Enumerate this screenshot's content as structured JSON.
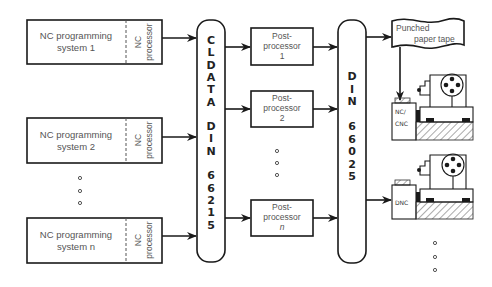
{
  "diagram": {
    "programming_systems": [
      {
        "line1": "NC programming",
        "line2": "system 1",
        "processor": [
          "NC",
          "processor"
        ]
      },
      {
        "line1": "NC programming",
        "line2": "system 2",
        "processor": [
          "NC",
          "processor"
        ]
      },
      {
        "line1": "NC programming",
        "line2": "system n",
        "processor": [
          "NC",
          "processor"
        ]
      }
    ],
    "cldata_bus": {
      "label": "CLDATA DIN 66215",
      "letters": [
        "C",
        "L",
        "D",
        "A",
        "T",
        "A",
        "",
        "D",
        "I",
        "N",
        "",
        "6",
        "6",
        "2",
        "1",
        "5"
      ]
    },
    "postprocessors": [
      {
        "line1": "Post-",
        "line2": "processor",
        "line3": "1"
      },
      {
        "line1": "Post-",
        "line2": "processor",
        "line3": "2"
      },
      {
        "line1": "Post-",
        "line2": "processor",
        "line3": "n"
      }
    ],
    "din_bus": {
      "label": "DIN 66025",
      "letters": [
        "D",
        "I",
        "N",
        "",
        "6",
        "6",
        "0",
        "2",
        "5"
      ]
    },
    "paper_tape": {
      "line1": "Punched",
      "line2": "paper tape"
    },
    "machines": [
      {
        "control_line1": "NC/",
        "control_line2": "CNC"
      },
      {
        "control_line1": "DNC",
        "control_line2": ""
      }
    ],
    "ellipsis_marker": "continuation-dots"
  }
}
